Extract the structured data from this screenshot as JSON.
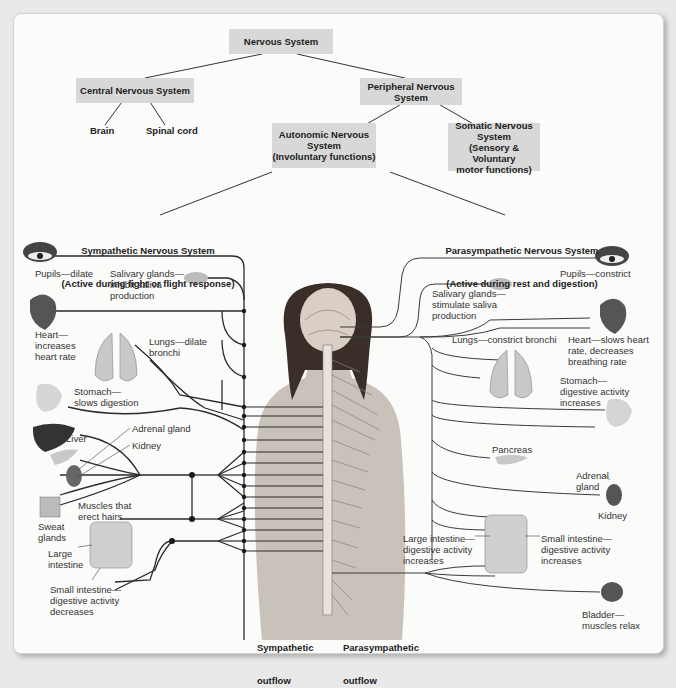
{
  "hierarchy": {
    "root": "Nervous System",
    "cns": "Central Nervous System",
    "cns_children": [
      "Brain",
      "Spinal cord"
    ],
    "pns": "Peripheral Nervous System",
    "autonomic": "Autonomic Nervous System (Involuntary functions)",
    "autonomic_line1": "Autonomic Nervous",
    "autonomic_line2": "System",
    "autonomic_line3": "(Involuntary functions)",
    "somatic_line1": "Somatic Nervous",
    "somatic_line2": "System",
    "somatic_line3": "(Sensory & Voluntary",
    "somatic_line4": "motor functions)",
    "pns_line1": "Peripheral Nervous",
    "pns_line2": "System"
  },
  "sympathetic": {
    "title": "Sympathetic Nervous System",
    "subtitle": "(Active during fight or flight response)",
    "outflow_label_1": "Sympathetic",
    "outflow_label_2": "outflow",
    "effects": [
      {
        "organ": "eye",
        "label": "Pupils—dilate"
      },
      {
        "organ": "salivary-glands",
        "label": "Salivary glands—\ninhibit saliva\nproduction"
      },
      {
        "organ": "heart",
        "label": "Heart—\nincreases\nheart rate"
      },
      {
        "organ": "lungs",
        "label": "Lungs—dilate\nbronchi"
      },
      {
        "organ": "stomach",
        "label": "Stomach—\nslows digestion"
      },
      {
        "organ": "liver",
        "label": "Liver"
      },
      {
        "organ": "adrenal-gland",
        "label": "Adrenal gland"
      },
      {
        "organ": "kidney",
        "label": "Kidney"
      },
      {
        "organ": "hair-muscles",
        "label": "Muscles that\nerect hairs"
      },
      {
        "organ": "sweat-glands",
        "label": "Sweat\nglands"
      },
      {
        "organ": "large-intestine",
        "label": "Large\nintestine"
      },
      {
        "organ": "small-intestine",
        "label": "Small intestine—\ndigestive activity\ndecreases"
      }
    ]
  },
  "parasympathetic": {
    "title": "Parasympathetic Nervous System",
    "subtitle": "(Active during rest and digestion)",
    "outflow_label_1": "Parasympathetic",
    "outflow_label_2": "outflow",
    "effects": [
      {
        "organ": "eye",
        "label": "Pupils—constrict"
      },
      {
        "organ": "salivary-glands",
        "label": "Salivary glands—\nstimulate saliva\nproduction"
      },
      {
        "organ": "heart",
        "label": "Heart—slows heart\nrate, decreases\nbreathing rate"
      },
      {
        "organ": "lungs",
        "label": "Lungs—constrict bronchi"
      },
      {
        "organ": "stomach",
        "label": "Stomach—\ndigestive activity\nincreases"
      },
      {
        "organ": "pancreas",
        "label": "Pancreas"
      },
      {
        "organ": "adrenal-gland",
        "label": "Adrenal\ngland"
      },
      {
        "organ": "kidney",
        "label": "Kidney"
      },
      {
        "organ": "large-intestine",
        "label": "Large intestine—\ndigestive activity\nincreases"
      },
      {
        "organ": "small-intestine",
        "label": "Small intestine—\ndigestive activity\nincreases"
      },
      {
        "organ": "bladder",
        "label": "Bladder—\nmuscles relax"
      }
    ]
  },
  "colors": {
    "box_fill": "#d8d8d8",
    "card_bg": "#fbfbfa",
    "wire": "#2a2a2a",
    "skin": "#c9c2bb"
  }
}
